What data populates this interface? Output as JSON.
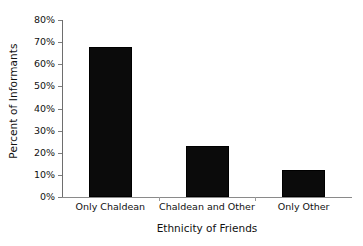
{
  "chart_data": {
    "type": "bar",
    "title": "",
    "subtitle": "",
    "xlabel": "Ethnicity of Friends",
    "ylabel": "Percent of Informants",
    "categories": [
      "Only Chaldean",
      "Chaldean and Other",
      "Only Other"
    ],
    "values": [
      68,
      23,
      12
    ],
    "value_labels": [
      "68%",
      "23%",
      "12%"
    ],
    "ylim": [
      0,
      80
    ],
    "ytick_labels": [
      "0%",
      "10%",
      "20%",
      "30%",
      "40%",
      "50%",
      "60%",
      "70%",
      "80%"
    ],
    "ytick_values": [
      0,
      10,
      20,
      30,
      40,
      50,
      60,
      70,
      80
    ],
    "grid": false,
    "legend": "none",
    "bar_color": "#0b0b0b",
    "axis_color": "#7d7d7d",
    "background_color": "#ffffff"
  },
  "axes": {
    "y_title": "Percent of Informants",
    "x_title": "Ethnicity of Friends"
  }
}
